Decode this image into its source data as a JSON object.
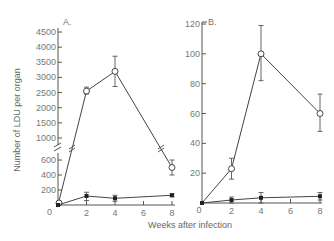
{
  "chart_data": [
    {
      "type": "line",
      "panel": "A.",
      "title": "",
      "xlabel": "Weeks after infection",
      "ylabel": "Number of LDU per organ",
      "x": [
        0,
        2,
        4,
        8
      ],
      "x_ticks": [
        "0",
        "2",
        "4",
        "6",
        "8"
      ],
      "y_ticks_upper": [
        "1000",
        "1500",
        "2000",
        "2500",
        "3000",
        "3500",
        "4000",
        "4500"
      ],
      "y_ticks_lower": [
        "200",
        "400",
        "600"
      ],
      "y_axis_break": true,
      "ylim": [
        0,
        4500
      ],
      "grid": false,
      "series": [
        {
          "name": "open circles",
          "marker": "open-circle",
          "values": [
            0,
            2550,
            3200,
            500
          ],
          "error_low": [
            0,
            2450,
            2700,
            400
          ],
          "error_high": [
            0,
            2680,
            3700,
            600
          ]
        },
        {
          "name": "filled squares",
          "marker": "filled-square",
          "values": [
            0,
            120,
            90,
            130
          ],
          "error_low": [
            0,
            60,
            50,
            110
          ],
          "error_high": [
            0,
            170,
            130,
            150
          ]
        }
      ]
    },
    {
      "type": "line",
      "panel": "B.",
      "title": "",
      "xlabel": "Weeks after infection",
      "ylabel": "",
      "x": [
        0,
        2,
        4,
        8
      ],
      "x_ticks": [
        "0",
        "2",
        "4",
        "6",
        "8"
      ],
      "y_ticks": [
        "20",
        "40",
        "60",
        "80",
        "100",
        "120"
      ],
      "ylim": [
        0,
        120
      ],
      "grid": false,
      "series": [
        {
          "name": "open circles",
          "marker": "open-circle",
          "values": [
            0,
            23,
            100,
            60
          ],
          "error_low": [
            0,
            16,
            82,
            48
          ],
          "error_high": [
            0,
            30,
            119,
            73
          ]
        },
        {
          "name": "filled squares",
          "marker": "filled-square",
          "values": [
            0,
            2,
            3.5,
            4.5
          ],
          "error_low": [
            0,
            0,
            0,
            2
          ],
          "error_high": [
            0,
            4,
            7,
            7
          ]
        }
      ]
    }
  ],
  "labels": {
    "panel_a": "A.",
    "panel_b": "B.",
    "ylabel": "Number of LDU per organ",
    "xlabel": "Weeks after infection",
    "origin_a": "0",
    "origin_b": "0"
  }
}
